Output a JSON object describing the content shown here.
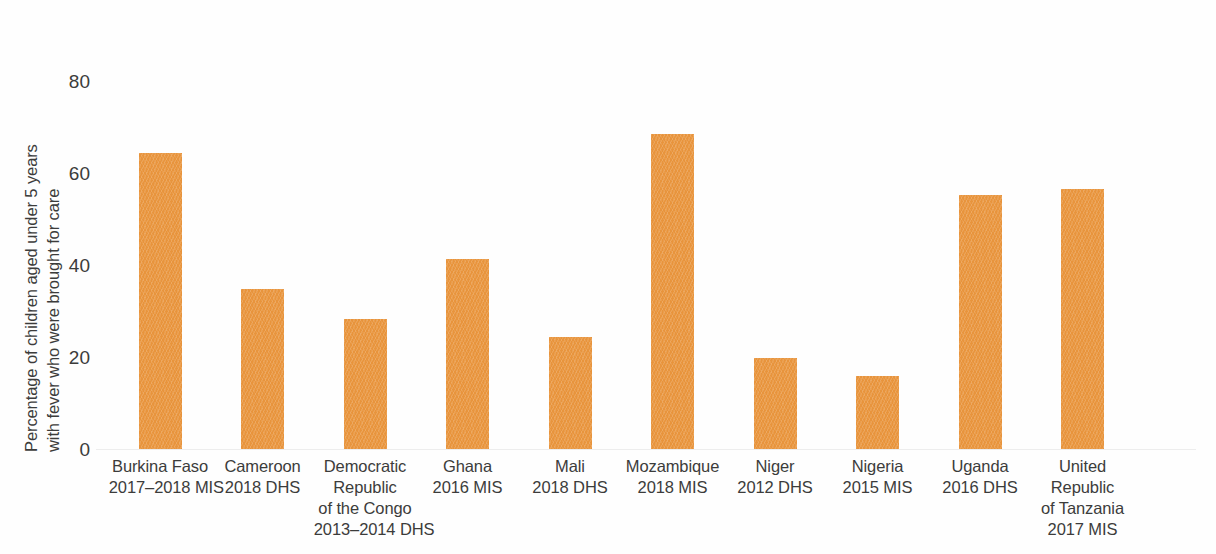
{
  "chart_data": {
    "type": "bar",
    "title": "",
    "subtitle": "",
    "xlabel": "",
    "ylabel": "Percentage of children aged under 5 years with fever who were brought for care",
    "ylabel_lines": [
      "Percentage of children aged under 5 years",
      "with fever who were brought for care"
    ],
    "ylim": [
      0,
      88
    ],
    "yticks": [
      0,
      20,
      40,
      60,
      80
    ],
    "ytick_labels": [
      "0",
      "20",
      "40",
      "60",
      "80"
    ],
    "grid": false,
    "legend": null,
    "bar_color": "#e8943c",
    "categories": [
      "Burkina Faso 2017–2018 MIS",
      "Cameroon 2018 DHS",
      "Democratic Republic of the Congo 2013–2014 DHS",
      "Ghana 2016 MIS",
      "Mali 2018 DHS",
      "Mozambique 2018 MIS",
      "Niger 2012 DHS",
      "Nigeria 2015 MIS",
      "Uganda 2016 DHS",
      "United Republic of Tanzania 2017 MIS"
    ],
    "category_label_lines": [
      [
        "Burkina Faso",
        "2017–2018 MIS"
      ],
      [
        "Cameroon",
        "2018 DHS"
      ],
      [
        "Democratic",
        "Republic",
        "of the Congo",
        "2013–2014 DHS"
      ],
      [
        "Ghana",
        "2016 MIS"
      ],
      [
        "Mali",
        "2018 DHS"
      ],
      [
        "Mozambique",
        "2018 MIS"
      ],
      [
        "Niger",
        "2012 DHS"
      ],
      [
        "Nigeria",
        "2015 MIS"
      ],
      [
        "Uganda",
        "2016 DHS"
      ],
      [
        "United",
        "Republic",
        "of Tanzania",
        "2017 MIS"
      ]
    ],
    "values": [
      64.3,
      34.8,
      28.3,
      41.3,
      24.3,
      68.4,
      19.8,
      15.8,
      55.2,
      56.6
    ]
  }
}
